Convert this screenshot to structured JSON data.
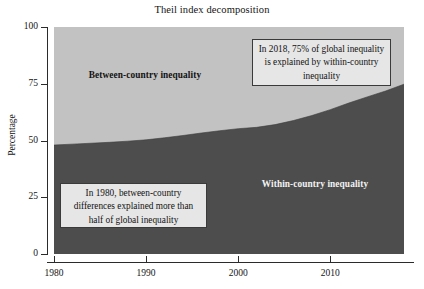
{
  "chart_data": {
    "type": "area",
    "title": "Theil index decomposition",
    "xlabel": "",
    "ylabel": "Percentage",
    "xlim": [
      1980,
      2018
    ],
    "ylim": [
      0,
      100
    ],
    "grid": false,
    "stacked": true,
    "legend_position": "none",
    "x_ticks": [
      "1980",
      "1990",
      "2000",
      "2010"
    ],
    "x_tick_values": [
      1980,
      1990,
      2000,
      2010
    ],
    "y_ticks": [
      "0",
      "25",
      "50",
      "75",
      "100"
    ],
    "y_tick_values": [
      0,
      25,
      50,
      75,
      100
    ],
    "x": [
      1980,
      1982,
      1984,
      1986,
      1988,
      1990,
      1992,
      1994,
      1996,
      1998,
      2000,
      2002,
      2004,
      2006,
      2008,
      2010,
      2012,
      2014,
      2016,
      2018
    ],
    "series": [
      {
        "name": "Within-country inequality",
        "color": "#4d4d4d",
        "values": [
          48,
          48.4,
          48.8,
          49.2,
          49.7,
          50.3,
          51.2,
          52.2,
          53.3,
          54.3,
          55.2,
          55.8,
          57.0,
          58.8,
          61.0,
          63.6,
          66.5,
          69.2,
          71.8,
          74.8
        ]
      },
      {
        "name": "Between-country inequality",
        "color": "#c2c2c2",
        "values": [
          52,
          51.6,
          51.2,
          50.8,
          50.3,
          49.7,
          48.8,
          47.8,
          46.7,
          45.7,
          44.8,
          44.2,
          43.0,
          41.2,
          39.0,
          36.4,
          33.5,
          30.8,
          28.2,
          25.2
        ]
      }
    ],
    "annotations": [
      {
        "id": "annotation-2018",
        "text": "In 2018, 75% of global inequality is explained by within-country inequality"
      },
      {
        "id": "annotation-1980",
        "text": "In 1980, between-country differences explained more than half of global inequality"
      }
    ],
    "area_labels": [
      {
        "id": "between-country",
        "text": "Between-country inequality"
      },
      {
        "id": "within-country",
        "text": "Within-country inequality"
      }
    ],
    "colors": {
      "between_country": "#c2c2c2",
      "within_country": "#4d4d4d",
      "axis": "#2b2b2b",
      "background": "#ffffff",
      "annotation_background": "#e6e6e6"
    }
  }
}
